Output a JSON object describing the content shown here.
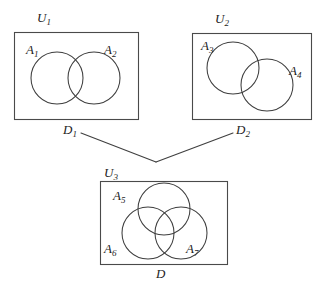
{
  "figure": {
    "type": "set-theory-venn-diagram-figure",
    "background_color": "#ffffff",
    "stroke_color": "#3d3d3d",
    "label_color": "#1d1d1d"
  },
  "diagrams": [
    {
      "id": "diagram-1",
      "universe_label": "U",
      "universe_subscript": "1",
      "bottom_label": "D",
      "bottom_subscript": "1",
      "sets": [
        {
          "label": "A",
          "subscript": "1"
        },
        {
          "label": "A",
          "subscript": "2"
        }
      ]
    },
    {
      "id": "diagram-2",
      "universe_label": "U",
      "universe_subscript": "2",
      "bottom_label": "D",
      "bottom_subscript": "2",
      "sets": [
        {
          "label": "A",
          "subscript": "3"
        },
        {
          "label": "A",
          "subscript": "4"
        }
      ]
    },
    {
      "id": "diagram-3",
      "universe_label": "U",
      "universe_subscript": "3",
      "bottom_label": "D",
      "bottom_subscript": "",
      "sets": [
        {
          "label": "A",
          "subscript": "5"
        },
        {
          "label": "A",
          "subscript": "6"
        },
        {
          "label": "A",
          "subscript": "7"
        }
      ]
    }
  ]
}
